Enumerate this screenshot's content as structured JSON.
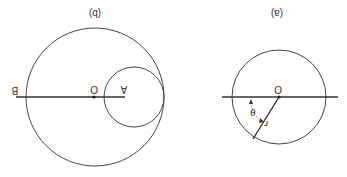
{
  "figure": {
    "orientation": "rotated-180",
    "stroke_color": "#444444",
    "panels": [
      {
        "id": "b",
        "caption": "(b)",
        "labels": {
          "left_end": "B",
          "center": "O",
          "right_end": "A"
        },
        "large_circle": {
          "cx": 95,
          "cy": 97,
          "r": 69
        },
        "small_circle": {
          "cx": 134,
          "cy": 97,
          "r": 30
        },
        "axis_line": {
          "x1": 16,
          "x2": 125,
          "y": 97
        }
      },
      {
        "id": "a",
        "caption": "(a)",
        "labels": {
          "center": "O",
          "radius": "r",
          "angle": "θ"
        },
        "circle": {
          "cx": 279,
          "cy": 97,
          "r": 47
        },
        "axis_line": {
          "x1": 222,
          "x2": 338,
          "y": 97
        },
        "radius_line": {
          "x1": 279,
          "y1": 97,
          "x2": 253,
          "y2": 139
        }
      }
    ]
  }
}
